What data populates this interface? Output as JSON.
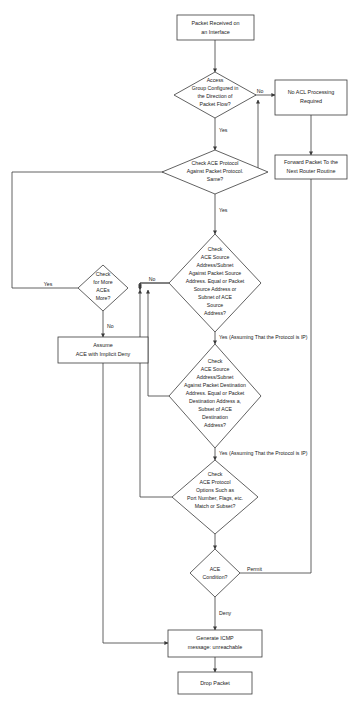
{
  "diagram": {
    "colors": {
      "stroke": "#3a3a3a",
      "fill": "#ffffff",
      "text": "#1a1a1a",
      "background": "#ffffff"
    },
    "nodes": [
      {
        "id": "packet-received",
        "type": "process",
        "lines": [
          "Packet Received on",
          "an Interface"
        ]
      },
      {
        "id": "access-group-configured",
        "type": "decision",
        "lines": [
          "Access",
          "Group Configured in",
          "the Direction of",
          "Packet Flow?"
        ]
      },
      {
        "id": "no-acl-processing",
        "type": "process",
        "lines": [
          "No ACL Processing",
          "Required"
        ]
      },
      {
        "id": "check-ace-protocol",
        "type": "decision",
        "lines": [
          "Check ACE Protocol",
          "Against Packet Protocol.",
          "Same?"
        ]
      },
      {
        "id": "forward-packet",
        "type": "process",
        "lines": [
          "Forward Packet To the",
          "Next Router Routine"
        ]
      },
      {
        "id": "check-source-address",
        "type": "decision",
        "lines": [
          "Check",
          "ACE Source",
          "Address/Subnet",
          "Against Packet Source",
          "Address. Equal or Packet",
          "Source Address or",
          "Subnet of ACE",
          "Source",
          "Address?"
        ]
      },
      {
        "id": "check-more-aces",
        "type": "decision",
        "lines": [
          "Check",
          "for More",
          "ACEs",
          "More?"
        ]
      },
      {
        "id": "assume-implicit-deny",
        "type": "process",
        "lines": [
          "Assume",
          "ACE with Implicit Deny"
        ]
      },
      {
        "id": "check-destination-address",
        "type": "decision",
        "lines": [
          "Check",
          "ACE Source",
          "Address/Subnet",
          "Against Packet Destination",
          "Address. Equal or Packet",
          "Destination Address a,",
          "Subset of ACE",
          "Destination",
          "Address?"
        ]
      },
      {
        "id": "check-protocol-options",
        "type": "decision",
        "lines": [
          "Check",
          "ACE Protocol",
          "Options Such as",
          "Port Number, Flags, etc.",
          "Match or Subset?"
        ]
      },
      {
        "id": "ace-condition",
        "type": "decision",
        "lines": [
          "ACE",
          "Condition?"
        ]
      },
      {
        "id": "generate-icmp",
        "type": "process",
        "lines": [
          "Generate ICMP",
          "message: unreachable"
        ]
      },
      {
        "id": "drop-packet",
        "type": "process",
        "lines": [
          "Drop Packet"
        ]
      }
    ],
    "edge_labels": [
      {
        "id": "label-no-access-group",
        "text": "No"
      },
      {
        "id": "label-yes-access-group",
        "text": "Yes"
      },
      {
        "id": "label-yes-protocol-same",
        "text": "Yes"
      },
      {
        "id": "label-no-source-address",
        "text": "No"
      },
      {
        "id": "label-yes-source-address",
        "text": "Yes (Assuming That the Protocol is IP)"
      },
      {
        "id": "label-yes-destination-address",
        "text": "Yes (Assuming That the Protocol is IP)"
      },
      {
        "id": "label-yes-more-aces",
        "text": "Yes"
      },
      {
        "id": "label-no-more-aces",
        "text": "No"
      },
      {
        "id": "label-permit",
        "text": "Permit"
      },
      {
        "id": "label-deny",
        "text": "Deny"
      }
    ]
  }
}
